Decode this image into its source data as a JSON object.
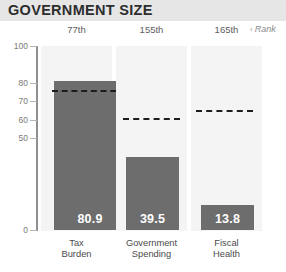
{
  "header": {
    "title": "GOVERNMENT SIZE"
  },
  "rank_legend": {
    "caret": "‹",
    "label": "Rank"
  },
  "chart_data": {
    "type": "bar",
    "title": "GOVERNMENT SIZE",
    "xlabel": "",
    "ylabel": "",
    "ylim": [
      0,
      100
    ],
    "grid": false,
    "legend": "none",
    "yticks": [
      100,
      80,
      70,
      60,
      50,
      0
    ],
    "ytick_labels": [
      "100",
      "80",
      "70",
      "60",
      "50",
      "0"
    ],
    "categories": [
      "Tax\nBurden",
      "Government\nSpending",
      "Fiscal\nHealth"
    ],
    "values": [
      80.9,
      39.5,
      13.8
    ],
    "value_labels": [
      "80.9",
      "39.5",
      "13.8"
    ],
    "ranks": [
      "77th",
      "155th",
      "165th"
    ],
    "reference_lines": [
      76.0,
      61.0,
      65.0
    ],
    "series": [
      {
        "name": "Score",
        "values": [
          80.9,
          39.5,
          13.8
        ]
      }
    ],
    "colors": {
      "bar": "#6d6d6d",
      "column_background": "#f4f4f4",
      "reference_line": "#1d1d1d",
      "title_band": "#e6e6e6",
      "value_text": "#ffffff"
    }
  }
}
